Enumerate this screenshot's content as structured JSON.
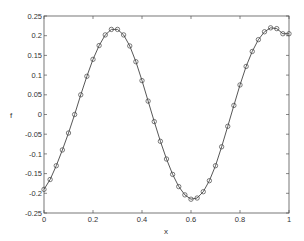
{
  "chart_data": {
    "type": "line",
    "title": "",
    "xlabel": "x",
    "ylabel": "f",
    "xlim": [
      0,
      1
    ],
    "ylim": [
      -0.25,
      0.25
    ],
    "grid": false,
    "xticks": [
      "0",
      "0.2",
      "0.4",
      "0.6",
      "0.8",
      "1"
    ],
    "yticks": [
      "0.25",
      "0.2",
      "0.15",
      "0.1",
      "0.05",
      "0",
      "-0.05",
      "-0.1",
      "-0.15",
      "-0.2",
      "-0.25"
    ],
    "series": [
      {
        "name": "f",
        "marker": "circle",
        "color": "#444444",
        "x": [
          0,
          0.025,
          0.05,
          0.075,
          0.1,
          0.125,
          0.15,
          0.175,
          0.2,
          0.225,
          0.25,
          0.275,
          0.3,
          0.325,
          0.35,
          0.375,
          0.4,
          0.425,
          0.45,
          0.475,
          0.5,
          0.525,
          0.55,
          0.575,
          0.6,
          0.625,
          0.65,
          0.675,
          0.7,
          0.725,
          0.75,
          0.775,
          0.8,
          0.825,
          0.85,
          0.875,
          0.9,
          0.925,
          0.95,
          0.975,
          1.0
        ],
        "values": [
          -0.19,
          -0.165,
          -0.13,
          -0.09,
          -0.047,
          0.0,
          0.05,
          0.097,
          0.14,
          0.175,
          0.202,
          0.216,
          0.216,
          0.202,
          0.174,
          0.134,
          0.086,
          0.034,
          -0.018,
          -0.068,
          -0.113,
          -0.152,
          -0.183,
          -0.204,
          -0.215,
          -0.212,
          -0.196,
          -0.168,
          -0.13,
          -0.082,
          -0.03,
          0.023,
          0.075,
          0.122,
          0.16,
          0.19,
          0.21,
          0.22,
          0.218,
          0.205,
          0.205
        ]
      }
    ]
  }
}
